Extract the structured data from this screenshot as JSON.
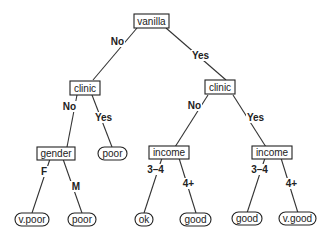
{
  "diagram": {
    "type": "decision-tree",
    "nodes": {
      "root": {
        "label": "vanilla",
        "kind": "decision"
      },
      "clinic_left": {
        "label": "clinic",
        "kind": "decision"
      },
      "clinic_right": {
        "label": "clinic",
        "kind": "decision"
      },
      "gender": {
        "label": "gender",
        "kind": "decision"
      },
      "income_left": {
        "label": "income",
        "kind": "decision"
      },
      "income_right": {
        "label": "income",
        "kind": "decision"
      },
      "leaf_vpoor": {
        "label": "v.poor",
        "kind": "leaf"
      },
      "leaf_poor_m": {
        "label": "poor",
        "kind": "leaf"
      },
      "leaf_poor_yes": {
        "label": "poor",
        "kind": "leaf"
      },
      "leaf_ok": {
        "label": "ok",
        "kind": "leaf"
      },
      "leaf_good_left": {
        "label": "good",
        "kind": "leaf"
      },
      "leaf_good_right": {
        "label": "good",
        "kind": "leaf"
      },
      "leaf_vgood": {
        "label": "v.good",
        "kind": "leaf"
      }
    },
    "edges": {
      "root_no": {
        "from": "root",
        "to": "clinic_left",
        "label": "No"
      },
      "root_yes": {
        "from": "root",
        "to": "clinic_right",
        "label": "Yes"
      },
      "clinicL_no": {
        "from": "clinic_left",
        "to": "gender",
        "label": "No"
      },
      "clinicL_yes": {
        "from": "clinic_left",
        "to": "leaf_poor_yes",
        "label": "Yes"
      },
      "clinicR_no": {
        "from": "clinic_right",
        "to": "income_left",
        "label": "No"
      },
      "clinicR_yes": {
        "from": "clinic_right",
        "to": "income_right",
        "label": "Yes"
      },
      "gender_f": {
        "from": "gender",
        "to": "leaf_vpoor",
        "label": "F"
      },
      "gender_m": {
        "from": "gender",
        "to": "leaf_poor_m",
        "label": "M"
      },
      "incomeL_34": {
        "from": "income_left",
        "to": "leaf_ok",
        "label": "3–4"
      },
      "incomeL_4p": {
        "from": "income_left",
        "to": "leaf_good_left",
        "label": "4+"
      },
      "incomeR_34": {
        "from": "income_right",
        "to": "leaf_good_right",
        "label": "3–4"
      },
      "incomeR_4p": {
        "from": "income_right",
        "to": "leaf_vgood",
        "label": "4+"
      }
    }
  }
}
